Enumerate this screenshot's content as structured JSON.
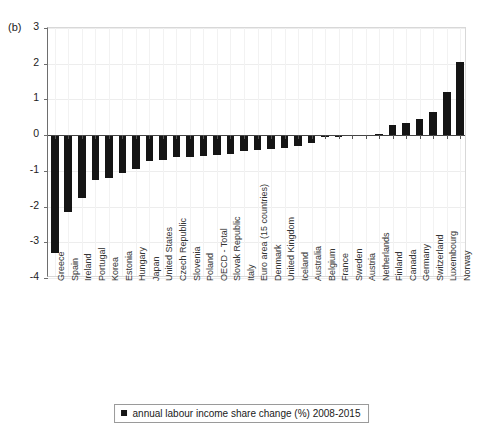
{
  "page_header": {
    "running_title": "",
    "page_number": ""
  },
  "figure": {
    "panel_label": "(b)",
    "legend": {
      "marker": "filled-square",
      "label": "annual labour income share change (%) 2008-2015"
    }
  },
  "chart_data": {
    "type": "bar",
    "title": "",
    "xlabel": "",
    "ylabel": "",
    "ylim": [
      -4,
      3
    ],
    "yticks": [
      3,
      2,
      1,
      0,
      -1,
      -2,
      -3,
      -4
    ],
    "ytick_labels": [
      "3",
      "2",
      "1",
      "0",
      "-1",
      "-2",
      "-3",
      "-4"
    ],
    "grid": true,
    "legend_position": "bottom-center",
    "series_name": "annual labour income share change (%) 2008-2015",
    "bar_color": "#151515",
    "categories": [
      "Greece",
      "Spain",
      "Ireland",
      "Portugal",
      "Korea",
      "Estonia",
      "Hungary",
      "Japan",
      "United States",
      "Czech Republic",
      "Slovenia",
      "Poland",
      "OECD - Total",
      "Slovak Republic",
      "Italy",
      "Euro area (15 countries)",
      "Denmark",
      "United Kingdom",
      "Iceland",
      "Australia",
      "Belgium",
      "France",
      "Sweden",
      "Austria",
      "Netherlands",
      "Finland",
      "Canada",
      "Germany",
      "Switzerland",
      "Luxembourg",
      "Norway"
    ],
    "values": [
      -3.3,
      -2.15,
      -1.75,
      -1.25,
      -1.2,
      -1.05,
      -0.95,
      -0.72,
      -0.7,
      -0.62,
      -0.6,
      -0.58,
      -0.55,
      -0.52,
      -0.45,
      -0.42,
      -0.38,
      -0.35,
      -0.3,
      -0.22,
      -0.05,
      -0.04,
      -0.03,
      -0.02,
      0.02,
      0.28,
      0.35,
      0.45,
      0.65,
      1.2,
      2.05
    ]
  }
}
